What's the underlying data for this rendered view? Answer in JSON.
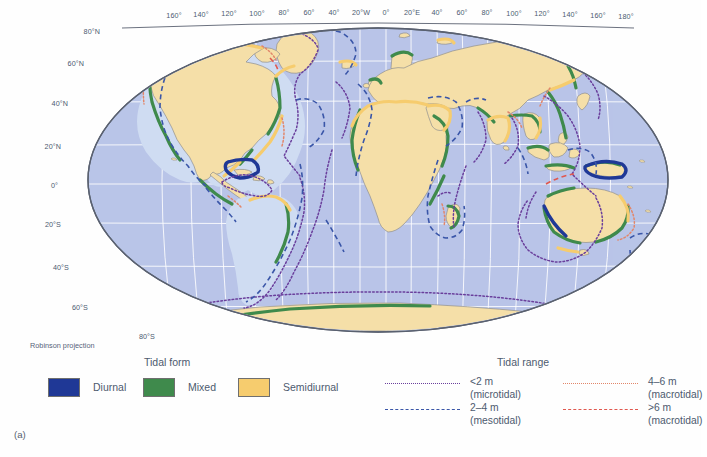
{
  "figure": {
    "panel_label": "(a)",
    "projection_note": "Robinson projection",
    "background": "#ffffff"
  },
  "map": {
    "type": "world-map",
    "projection": "Robinson",
    "ocean_color": "#b9c6e8",
    "land_color": "#f5dfa8",
    "land_outline": "#8f8f8f",
    "graticule_color": "#ffffff",
    "frame_color": "#5a6170",
    "shelf_color": "#cfdcf2",
    "longitude_labels": [
      {
        "text": "160°",
        "x": 174
      },
      {
        "text": "140°",
        "x": 201
      },
      {
        "text": "120°",
        "x": 229
      },
      {
        "text": "100°",
        "x": 257
      },
      {
        "text": "80°",
        "x": 284
      },
      {
        "text": "60°",
        "x": 309
      },
      {
        "text": "40°",
        "x": 334
      },
      {
        "text": "20°W",
        "x": 360
      },
      {
        "text": "0°",
        "x": 386
      },
      {
        "text": "20°E",
        "x": 411
      },
      {
        "text": "40°",
        "x": 437
      },
      {
        "text": "60°",
        "x": 462
      },
      {
        "text": "80°",
        "x": 487
      },
      {
        "text": "100°",
        "x": 514
      },
      {
        "text": "120°",
        "x": 542
      },
      {
        "text": "140°",
        "x": 570
      },
      {
        "text": "160°",
        "x": 598
      },
      {
        "text": "180°",
        "x": 626
      }
    ],
    "latitude_labels": [
      {
        "text": "80°N",
        "x": 100,
        "y": 30
      },
      {
        "text": "60°N",
        "x": 84,
        "y": 62
      },
      {
        "text": "40°N",
        "x": 68,
        "y": 102
      },
      {
        "text": "20°N",
        "x": 60,
        "y": 145
      },
      {
        "text": "0°",
        "x": 57,
        "y": 184
      },
      {
        "text": "20°S",
        "x": 60,
        "y": 223
      },
      {
        "text": "40°S",
        "x": 68,
        "y": 266
      },
      {
        "text": "60°S",
        "x": 86,
        "y": 306
      },
      {
        "text": "80°S",
        "x": 152,
        "y": 334
      }
    ]
  },
  "legend": {
    "tidal_form": {
      "title": "Tidal form",
      "items": [
        {
          "label": "Diurnal",
          "color": "#1f3896"
        },
        {
          "label": "Mixed",
          "color": "#3f8a4c"
        },
        {
          "label": "Semidiurnal",
          "color": "#f6cc6e"
        }
      ]
    },
    "tidal_range": {
      "title": "Tidal range",
      "items": [
        {
          "line1": "<2 m",
          "line2": "(microtidal)",
          "color": "#6a3f9c",
          "style": "dotted"
        },
        {
          "line1": "2–4 m",
          "line2": "(mesotidal)",
          "color": "#3a56a8",
          "style": "dashed"
        },
        {
          "line1": "4–6 m",
          "line2": "(macrotidal)",
          "color": "#e2866a",
          "style": "dotted"
        },
        {
          "line1": ">6 m",
          "line2": "(macrotidal)",
          "color": "#e0584f",
          "style": "dashed"
        }
      ]
    }
  }
}
